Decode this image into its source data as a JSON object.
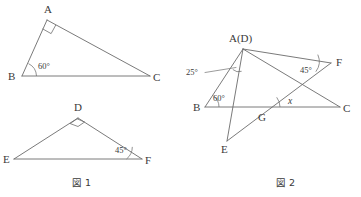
{
  "figure": {
    "title_fig1": "図 1",
    "title_fig2": "図 2",
    "caption_fig1_x": 90,
    "caption_fig1_y": 186,
    "caption_fig2_x": 282,
    "caption_fig2_y": 186
  },
  "fig1": {
    "triangle_abc": {
      "vertices": [
        {
          "id": "A",
          "label": "A",
          "x": 47,
          "y": 20,
          "label_x": 44,
          "label_y": 13
        },
        {
          "id": "B",
          "label": "B",
          "x": 22,
          "y": 76,
          "label_x": 8,
          "label_y": 80
        },
        {
          "id": "C",
          "label": "C",
          "x": 150,
          "y": 76,
          "label_x": 153,
          "label_y": 81
        }
      ],
      "edges": [
        {
          "from": "A",
          "to": "B"
        },
        {
          "from": "B",
          "to": "C"
        },
        {
          "from": "C",
          "to": "A"
        }
      ],
      "angles": [
        {
          "at": "A",
          "label": "",
          "type": "right-angle",
          "mark": "square"
        },
        {
          "at": "B",
          "label": "60°",
          "type": "arc",
          "label_x": 38,
          "label_y": 69
        }
      ]
    },
    "triangle_def": {
      "vertices": [
        {
          "id": "D",
          "label": "D",
          "x": 78,
          "y": 118,
          "label_x": 74,
          "label_y": 111
        },
        {
          "id": "E",
          "label": "E",
          "x": 14,
          "y": 159,
          "label_x": 3,
          "label_y": 163
        },
        {
          "id": "F",
          "label": "F",
          "x": 142,
          "y": 159,
          "label_x": 145,
          "label_y": 164
        }
      ],
      "edges": [
        {
          "from": "D",
          "to": "E"
        },
        {
          "from": "E",
          "to": "F"
        },
        {
          "from": "F",
          "to": "D"
        }
      ],
      "angles": [
        {
          "at": "D",
          "label": "",
          "type": "right-angle",
          "mark": "square"
        },
        {
          "at": "F",
          "label": "45°",
          "type": "arc",
          "label_x": 117,
          "label_y": 153
        }
      ]
    }
  },
  "fig2": {
    "vertices": [
      {
        "id": "AD",
        "label": "A(D)",
        "x": 243,
        "y": 49,
        "label_x": 231,
        "label_y": 42
      },
      {
        "id": "B",
        "label": "B",
        "x": 205,
        "y": 107,
        "label_x": 194,
        "label_y": 111
      },
      {
        "id": "C",
        "label": "C",
        "x": 340,
        "y": 107,
        "label_x": 343,
        "label_y": 112
      },
      {
        "id": "E",
        "label": "E",
        "x": 227,
        "y": 141,
        "label_x": 222,
        "label_y": 153
      },
      {
        "id": "F",
        "label": "F",
        "x": 331,
        "y": 63,
        "label_x": 336,
        "label_y": 66
      },
      {
        "id": "G",
        "label": "G",
        "x": 264,
        "y": 107,
        "label_x": 259,
        "label_y": 120
      }
    ],
    "edges": [
      {
        "from": "AD",
        "to": "B",
        "name": "segment-ad-b"
      },
      {
        "from": "B",
        "to": "C",
        "name": "segment-b-c"
      },
      {
        "from": "AD",
        "to": "C",
        "name": "segment-ad-c"
      },
      {
        "from": "AD",
        "to": "E",
        "name": "segment-ad-e"
      },
      {
        "from": "AD",
        "to": "F",
        "name": "segment-ad-f"
      },
      {
        "from": "E",
        "to": "F",
        "name": "segment-e-f"
      }
    ],
    "angles": [
      {
        "id": "angle-25",
        "label": "25°",
        "label_x": 190,
        "label_y": 74,
        "vertex_x": 237,
        "vertex_y": 66,
        "leader": true
      },
      {
        "id": "angle-60",
        "label": "60°",
        "label_x": 212,
        "label_y": 100,
        "vertex": "B"
      },
      {
        "id": "angle-45",
        "label": "45°",
        "label_x": 303,
        "label_y": 73,
        "vertex": "F"
      },
      {
        "id": "angle-x",
        "label": "x",
        "label_x": 288,
        "label_y": 103,
        "vertex": "G"
      }
    ]
  },
  "colors": {
    "stroke": "#6b6b6b",
    "text": "#3a3a3a",
    "background": "#ffffff"
  }
}
